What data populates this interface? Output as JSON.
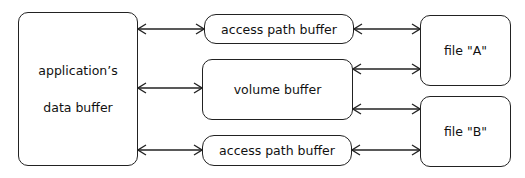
{
  "diagram": {
    "nodes": {
      "app_buffer": {
        "line1": "application’s",
        "line2": "data buffer"
      },
      "access_path_top": {
        "label": "access path buffer"
      },
      "volume_buffer": {
        "label": "volume buffer"
      },
      "access_path_bottom": {
        "label": "access path buffer"
      },
      "file_a": {
        "label": "file \"A\""
      },
      "file_b": {
        "label": "file \"B\""
      }
    },
    "edges": [
      {
        "from": "app_buffer",
        "to": "access_path_top",
        "type": "bidirectional"
      },
      {
        "from": "app_buffer",
        "to": "volume_buffer",
        "type": "bidirectional"
      },
      {
        "from": "app_buffer",
        "to": "access_path_bottom",
        "type": "bidirectional"
      },
      {
        "from": "access_path_top",
        "to": "file_a",
        "type": "bidirectional"
      },
      {
        "from": "volume_buffer",
        "to": "file_a",
        "type": "bidirectional"
      },
      {
        "from": "volume_buffer",
        "to": "file_b",
        "type": "bidirectional"
      },
      {
        "from": "access_path_bottom",
        "to": "file_b",
        "type": "bidirectional"
      }
    ]
  }
}
